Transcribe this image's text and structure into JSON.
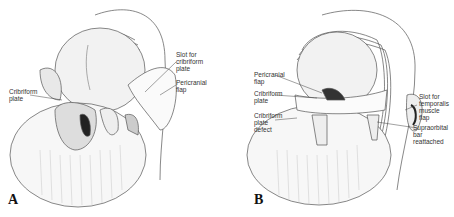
{
  "figure": {
    "panels": [
      {
        "letter": "A",
        "labels": {
          "cribriform_plate": "Cribriform\nplate",
          "slot_cribriform": "Slot for\ncribriform\nplate",
          "pericranial_flap": "Pericranial\nflap"
        }
      },
      {
        "letter": "B",
        "labels": {
          "pericranial_flap": "Pericranial\nflap",
          "cribriform_plate": "Cribriform\nplate",
          "cribriform_defect": "Cribriform\nplate\ndefect",
          "slot_temporalis": "Slot for\ntemporalis\nmuscle\nflap",
          "supraorbital_bar": "Supraorbital\nbar\nreattached"
        }
      }
    ]
  }
}
